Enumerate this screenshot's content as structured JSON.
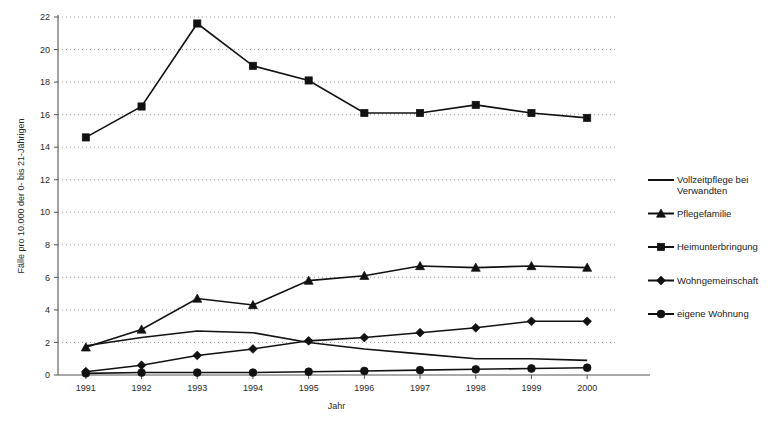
{
  "chart_data": {
    "type": "line",
    "title": "",
    "xlabel": "Jahr",
    "ylabel": "Fälle pro 10.000 der 0- bis 21-Jährigen",
    "categories": [
      "1991",
      "1992",
      "1993",
      "1994",
      "1995",
      "1996",
      "1997",
      "1998",
      "1999",
      "2000"
    ],
    "x": [
      1991,
      1992,
      1993,
      1994,
      1995,
      1996,
      1997,
      1998,
      1999,
      2000
    ],
    "ylim": [
      0,
      22
    ],
    "yticks": [
      0,
      2,
      4,
      6,
      8,
      10,
      12,
      14,
      16,
      18,
      20,
      22
    ],
    "ytick_labels": [
      "0",
      "2",
      "4",
      "6",
      "8",
      "10",
      "12",
      "14",
      "16",
      "18",
      "20",
      "22"
    ],
    "grid": true,
    "grid_axis": "y",
    "grid_style": "dotted",
    "legend_position": "right",
    "series": [
      {
        "name": "Vollzeitpflege bei Verwandten",
        "marker": "none",
        "values": [
          1.8,
          2.3,
          2.7,
          2.6,
          2.0,
          1.6,
          1.3,
          1.0,
          1.0,
          0.9
        ]
      },
      {
        "name": "Pflegefamilie",
        "marker": "triangle",
        "values": [
          1.7,
          2.8,
          4.7,
          4.3,
          5.8,
          6.1,
          6.7,
          6.6,
          6.7,
          6.6
        ]
      },
      {
        "name": "Heimunterbringung",
        "marker": "square",
        "values": [
          14.6,
          16.5,
          21.6,
          19.0,
          18.1,
          16.1,
          16.1,
          16.6,
          16.1,
          15.8
        ]
      },
      {
        "name": "Wohngemeinschaft",
        "marker": "diamond",
        "values": [
          0.2,
          0.6,
          1.2,
          1.6,
          2.1,
          2.3,
          2.6,
          2.9,
          3.3,
          3.3
        ]
      },
      {
        "name": "eigene Wohnung",
        "marker": "circle",
        "values": [
          0.1,
          0.15,
          0.15,
          0.15,
          0.2,
          0.25,
          0.3,
          0.35,
          0.4,
          0.45
        ]
      }
    ]
  },
  "legend": {
    "entries": [
      {
        "label_line1": "Vollzeitpflege bei",
        "label_line2": "Verwandten",
        "marker": "none"
      },
      {
        "label_line1": "Pflegefamilie",
        "label_line2": "",
        "marker": "triangle"
      },
      {
        "label_line1": "Heimunterbringung",
        "label_line2": "",
        "marker": "square"
      },
      {
        "label_line1": "Wohngemeinschaft",
        "label_line2": "",
        "marker": "diamond"
      },
      {
        "label_line1": "eigene Wohnung",
        "label_line2": "",
        "marker": "circle"
      }
    ]
  },
  "colors": {
    "series": "#111111",
    "grid": "#8a8a8a",
    "axis": "#555555",
    "text": "#1a1a1a",
    "background": "#ffffff"
  }
}
